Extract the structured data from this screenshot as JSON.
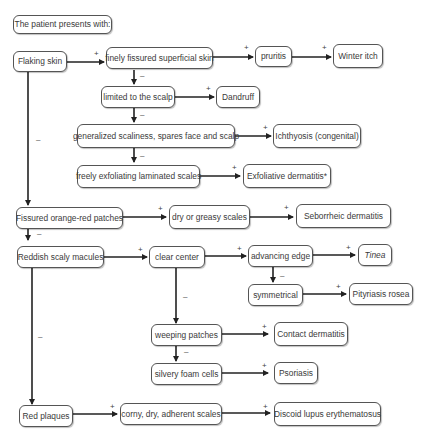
{
  "title": "The patient presents with:",
  "nodes": {
    "flaking_skin": "Flaking skin",
    "finely_fissured": "finely fissured superficial skin",
    "pruritis": "pruritis",
    "winter_itch": "Winter itch",
    "limited_scalp": "limited to the scalp",
    "dandruff": "Dandruff",
    "generalized_scaliness": "generalized scaliness, spares face and scalp",
    "ichthyosis": "Ichthyosis (congenital)",
    "freely_exfoliating": "freely exfoliating laminated scales",
    "exfoliative_dermatitis": "Exfoliative dermatitis*",
    "fissured_orange_red": "Fissured orange-red patches",
    "dry_greasy": "dry or greasy scales",
    "seborrheic": "Seborrheic dermatitis",
    "reddish_macules": "Reddish scaly macules",
    "clear_center": "clear center",
    "advancing_edge": "advancing edge",
    "tinea": "Tinea",
    "symmetrical": "symmetrical",
    "pityriasis_rosea": "Pityriasis rosea",
    "weeping_patches": "weeping patches",
    "contact_dermatitis": "Contact dermatitis",
    "silvery_foam": "silvery foam cells",
    "psoriasis": "Psoriasis",
    "red_plaques": "Red plaques",
    "corny_scales": "corny, dry, adherent scales",
    "discoid_lupus": "Discoid lupus erythematosus"
  },
  "signs": {
    "positive": "+",
    "negative": "–"
  },
  "edges": [
    {
      "from": "Flaking skin",
      "to": "finely fissured superficial skin",
      "sign": "+"
    },
    {
      "from": "finely fissured superficial skin",
      "to": "pruritis",
      "sign": "+"
    },
    {
      "from": "pruritis",
      "to": "Winter itch",
      "sign": "+"
    },
    {
      "from": "finely fissured superficial skin",
      "to": "limited to the scalp",
      "sign": "–"
    },
    {
      "from": "limited to the scalp",
      "to": "Dandruff",
      "sign": "+"
    },
    {
      "from": "limited to the scalp",
      "to": "generalized scaliness, spares face and scalp",
      "sign": "–"
    },
    {
      "from": "generalized scaliness, spares face and scalp",
      "to": "Ichthyosis (congenital)",
      "sign": "+"
    },
    {
      "from": "generalized scaliness, spares face and scalp",
      "to": "freely exfoliating laminated scales",
      "sign": "–"
    },
    {
      "from": "freely exfoliating laminated scales",
      "to": "Exfoliative dermatitis*",
      "sign": "+"
    },
    {
      "from": "Flaking skin",
      "to": "Fissured orange-red patches",
      "sign": "–"
    },
    {
      "from": "Fissured orange-red patches",
      "to": "dry or greasy scales",
      "sign": "+"
    },
    {
      "from": "dry or greasy scales",
      "to": "Seborrheic dermatitis",
      "sign": "+"
    },
    {
      "from": "Fissured orange-red patches",
      "to": "Reddish scaly macules",
      "sign": "–"
    },
    {
      "from": "Reddish scaly macules",
      "to": "clear center",
      "sign": "+"
    },
    {
      "from": "clear center",
      "to": "advancing edge",
      "sign": "+"
    },
    {
      "from": "advancing edge",
      "to": "Tinea",
      "sign": "+"
    },
    {
      "from": "advancing edge",
      "to": "symmetrical",
      "sign": "–"
    },
    {
      "from": "symmetrical",
      "to": "Pityriasis rosea",
      "sign": "+"
    },
    {
      "from": "clear center",
      "to": "weeping patches",
      "sign": "–"
    },
    {
      "from": "weeping patches",
      "to": "Contact dermatitis",
      "sign": "+"
    },
    {
      "from": "weeping patches",
      "to": "silvery foam cells",
      "sign": "–"
    },
    {
      "from": "silvery foam cells",
      "to": "Psoriasis",
      "sign": "+"
    },
    {
      "from": "Reddish scaly macules",
      "to": "Red plaques",
      "sign": "–"
    },
    {
      "from": "Red plaques",
      "to": "corny, dry, adherent scales",
      "sign": "+"
    },
    {
      "from": "corny, dry, adherent scales",
      "to": "Discoid lupus erythematosus",
      "sign": "+"
    }
  ]
}
